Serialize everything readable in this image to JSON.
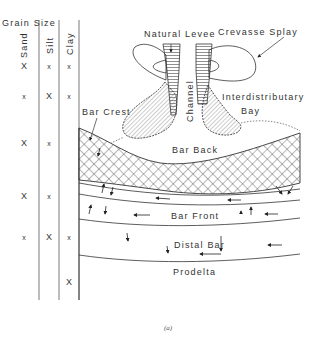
{
  "figure": {
    "caption": "(a)",
    "grain_size": {
      "title": "Grain Size",
      "columns": [
        "Sand",
        "Silt",
        "Clay"
      ],
      "rows": [
        {
          "y": 69,
          "sand": "X",
          "silt": "x",
          "clay": "x"
        },
        {
          "y": 99,
          "sand": "x",
          "silt": "X",
          "clay": "x"
        },
        {
          "y": 143,
          "sand": "X",
          "silt": "x",
          "clay": ""
        },
        {
          "y": 196,
          "sand": "X",
          "silt": "x",
          "clay": ""
        },
        {
          "y": 237,
          "sand": "x",
          "silt": "X",
          "clay": "x"
        },
        {
          "y": 281,
          "sand": "",
          "silt": "",
          "clay": "X"
        }
      ]
    },
    "labels": {
      "natural_levee": "Natural Levee",
      "crevasse_splay": "Crevasse Splay",
      "channel": "Channel",
      "interdistributary": "Interdistributary",
      "bay": "Bay",
      "bar_crest": "Bar Crest",
      "bar_back": "Bar Back",
      "bar_front": "Bar Front",
      "distal_bar": "Distal Bar",
      "prodelta": "Prodelta"
    }
  }
}
